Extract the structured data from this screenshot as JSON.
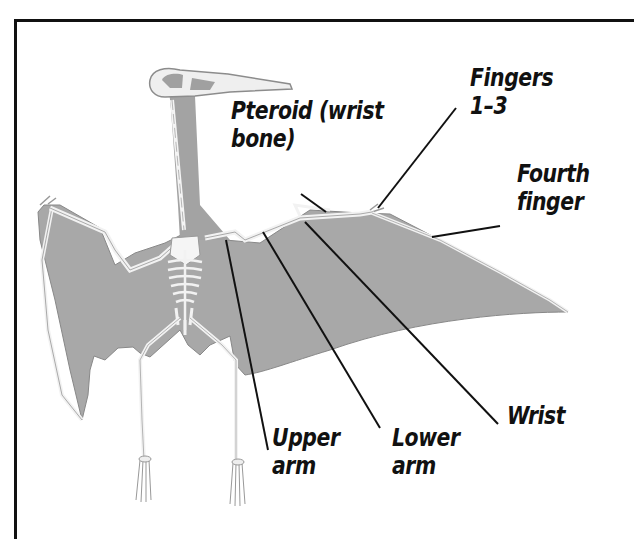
{
  "diagram": {
    "colors": {
      "membrane": "#a6a6a6",
      "bone": "#f2f2f2",
      "bone_outline": "#8a8a8a",
      "leader_line": "#111111",
      "frame": "#111111",
      "background": "#ffffff"
    },
    "labels": [
      {
        "id": "pteroid",
        "line1": "Pteroid (wrist",
        "line2": "bone)"
      },
      {
        "id": "fingers",
        "line1": "Fingers",
        "line2": "1–3"
      },
      {
        "id": "fourth-finger",
        "line1": "Fourth",
        "line2": "finger"
      },
      {
        "id": "wrist",
        "line1": "Wrist",
        "line2": ""
      },
      {
        "id": "upper-arm",
        "line1": "Upper",
        "line2": "arm"
      },
      {
        "id": "lower-arm",
        "line1": "Lower",
        "line2": "arm"
      }
    ]
  }
}
